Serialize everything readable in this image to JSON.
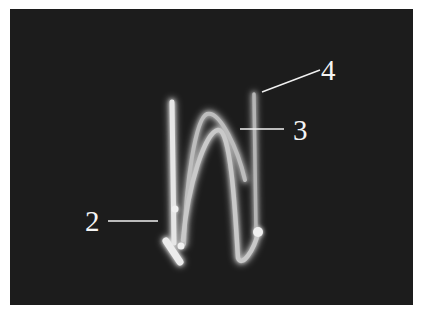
{
  "figure": {
    "background_color": "#1c1c1c",
    "page_color": "#ffffff",
    "callouts": [
      {
        "id": "2",
        "label": "2"
      },
      {
        "id": "3",
        "label": "3"
      },
      {
        "id": "4",
        "label": "4"
      }
    ]
  }
}
